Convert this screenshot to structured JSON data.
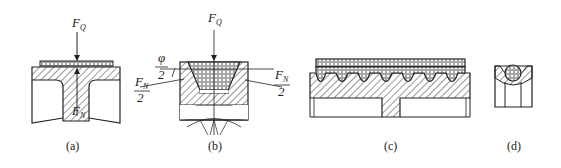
{
  "figure": {
    "panels": [
      {
        "id": "a",
        "caption": "(a)",
        "description": "flat belt on pulley",
        "labels": {
          "load": "F",
          "load_sub": "Q",
          "normal": "F",
          "normal_sub": "N"
        }
      },
      {
        "id": "b",
        "caption": "(b)",
        "description": "V-belt in grooved pulley",
        "labels": {
          "load": "F",
          "load_sub": "Q",
          "angle": "φ",
          "angle_den": "2",
          "normal_left": "F",
          "normal_left_sub": "N",
          "normal_left_den": "2",
          "normal_right": "F",
          "normal_right_sub": "N",
          "normal_right_den": "2"
        }
      },
      {
        "id": "c",
        "caption": "(c)",
        "description": "multi-ribbed belt on pulley"
      },
      {
        "id": "d",
        "caption": "(d)",
        "description": "round belt in groove"
      }
    ]
  }
}
